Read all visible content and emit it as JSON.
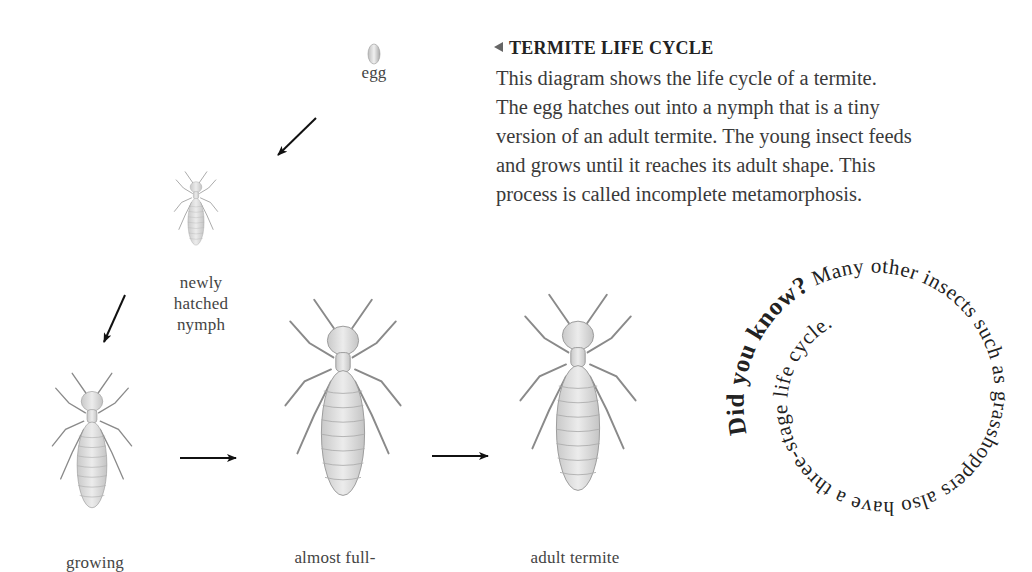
{
  "title": "TERMITE LIFE CYCLE",
  "description_lines": [
    "This diagram shows the life cycle of a termite.",
    "The egg hatches out into a nymph that is a tiny",
    "version of an adult termite. The young insect feeds",
    "and grows until it reaches its adult shape. This",
    "process is called incomplete metamorphosis."
  ],
  "stages": [
    {
      "name": "egg",
      "label": "egg"
    },
    {
      "name": "nymph",
      "label_lines": [
        "newly",
        "hatched",
        "nymph"
      ]
    },
    {
      "name": "growing",
      "label": "growing"
    },
    {
      "name": "almost-full",
      "label": "almost full-"
    },
    {
      "name": "adult",
      "label": "adult termite"
    }
  ],
  "did_you_know": {
    "lead": "Did you know?",
    "text": " Many other insects such as grasshoppers also have a three-stage life cycle."
  },
  "colors": {
    "text": "#3a3a3a",
    "insect_fill": "#e2e2e2",
    "insect_stroke": "#8a8a8a",
    "arrow": "#111111"
  }
}
